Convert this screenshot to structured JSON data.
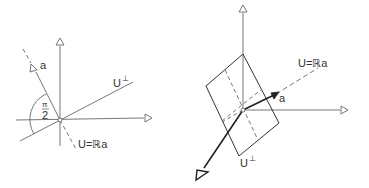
{
  "figures": [
    {
      "id": "planar",
      "labels": {
        "vector": "a",
        "angle_num": "π",
        "angle_den": "2",
        "line_u": "U=ℝa",
        "complement": "U",
        "perp": "⊥"
      }
    },
    {
      "id": "spatial",
      "labels": {
        "vector": "a",
        "line_u": "U=ℝa",
        "complement": "U",
        "perp": "⊥"
      }
    }
  ],
  "colors": {
    "stroke": "#555555",
    "bold": "#222222",
    "background": "#ffffff"
  }
}
